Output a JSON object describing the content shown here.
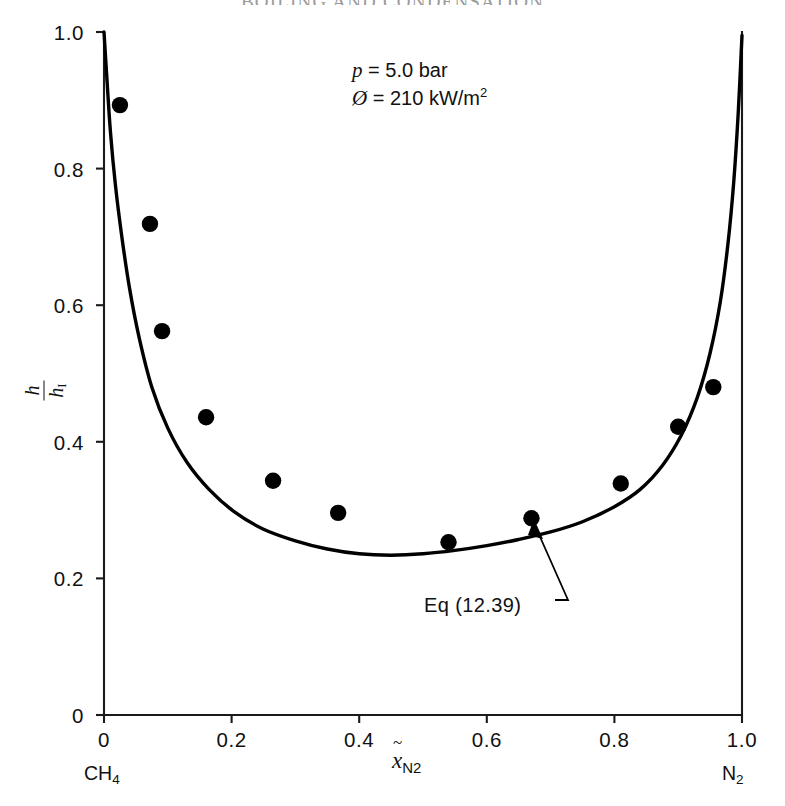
{
  "page": {
    "running_head": "BOILING AND CONDENSATION"
  },
  "figure": {
    "conditions": {
      "pressure_symbol": "p",
      "pressure_value": "= 5.0 bar",
      "heatflux_symbol": "Ø",
      "heatflux_value": "= 210 kW/m",
      "heatflux_exponent": "2"
    },
    "annotation": {
      "label": "Eq (12.39)"
    },
    "axis_endpoints": {
      "left": "CH",
      "left_sub": "4",
      "right": "N",
      "right_sub": "2"
    },
    "yaxis_title": {
      "numerator": "h",
      "denominator": "h",
      "denominator_sub": "I"
    },
    "xaxis_title": {
      "symbol": "x",
      "subscript": "N",
      "subscript2": "2"
    }
  },
  "chart_data": {
    "type": "scatter",
    "title": "",
    "xlabel": "x̃_N2",
    "ylabel": "h/h_I",
    "xlim": [
      0,
      1.0
    ],
    "ylim": [
      0,
      1.0
    ],
    "grid": false,
    "legend": "none",
    "xticks": [
      "0",
      "0.2",
      "0.4",
      "0.6",
      "0.8",
      "1.0"
    ],
    "xtick_values": [
      0,
      0.2,
      0.4,
      0.6,
      0.8,
      1.0
    ],
    "yticks": [
      "0",
      "0.2",
      "0.4",
      "0.6",
      "0.8",
      "1.0"
    ],
    "ytick_values": [
      0,
      0.2,
      0.4,
      0.6,
      0.8,
      1.0
    ],
    "series": [
      {
        "name": "Measured data",
        "type": "scatter",
        "marker": "filled-circle",
        "color": "#000000",
        "x": [
          0.025,
          0.072,
          0.091,
          0.16,
          0.265,
          0.367,
          0.54,
          0.67,
          0.81,
          0.9,
          0.955
        ],
        "y": [
          0.893,
          0.719,
          0.562,
          0.436,
          0.343,
          0.296,
          0.253,
          0.288,
          0.339,
          0.422,
          0.48
        ]
      },
      {
        "name": "Eq (12.39)",
        "type": "line",
        "color": "#000000",
        "x": [
          0.0,
          0.004,
          0.01,
          0.018,
          0.028,
          0.04,
          0.055,
          0.075,
          0.1,
          0.13,
          0.165,
          0.205,
          0.25,
          0.3,
          0.35,
          0.4,
          0.45,
          0.5,
          0.55,
          0.6,
          0.65,
          0.7,
          0.75,
          0.8,
          0.84,
          0.875,
          0.905,
          0.93,
          0.95,
          0.966,
          0.978,
          0.987,
          0.994,
          1.0
        ],
        "y": [
          1.0,
          0.94,
          0.855,
          0.775,
          0.7,
          0.625,
          0.553,
          0.48,
          0.42,
          0.37,
          0.33,
          0.297,
          0.272,
          0.255,
          0.243,
          0.236,
          0.234,
          0.236,
          0.241,
          0.248,
          0.257,
          0.268,
          0.283,
          0.305,
          0.33,
          0.365,
          0.41,
          0.465,
          0.53,
          0.605,
          0.69,
          0.78,
          0.88,
          0.995
        ]
      }
    ],
    "annotations": [
      {
        "text": "p = 5.0 bar",
        "x": 0.42,
        "y": 0.925
      },
      {
        "text": "Ø = 210 kW/m²",
        "x": 0.42,
        "y": 0.865
      },
      {
        "text": "Eq (12.39)",
        "x": 0.52,
        "y": 0.155,
        "arrow_to_x": 0.665,
        "arrow_to_y": 0.262
      }
    ]
  }
}
